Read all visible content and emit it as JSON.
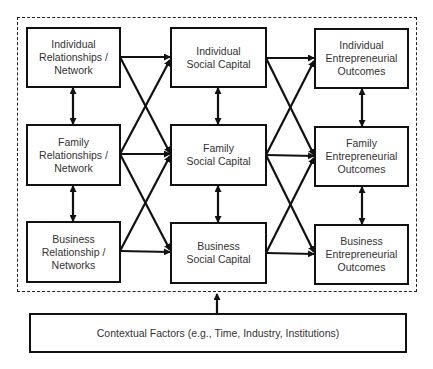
{
  "diagram": {
    "columns": [
      {
        "name": "relationships-networks",
        "nodes": [
          {
            "id": "ind-rel",
            "label": "Individual\nRelationships /\nNetwork"
          },
          {
            "id": "fam-rel",
            "label": "Family\nRelationships /\nNetwork"
          },
          {
            "id": "bus-rel",
            "label": "Business\nRelationship /\nNetworks"
          }
        ]
      },
      {
        "name": "social-capital",
        "nodes": [
          {
            "id": "ind-sc",
            "label": "Individual\nSocial Capital"
          },
          {
            "id": "fam-sc",
            "label": "Family\nSocial Capital"
          },
          {
            "id": "bus-sc",
            "label": "Business\nSocial Capital"
          }
        ]
      },
      {
        "name": "entrepreneurial-outcomes",
        "nodes": [
          {
            "id": "ind-eo",
            "label": "Individual\nEntrepreneurial\nOutcomes"
          },
          {
            "id": "fam-eo",
            "label": "Family\nEntrepreneurial\nOutcomes"
          },
          {
            "id": "bus-eo",
            "label": "Business\nEntrepreneurial\nOutcomes"
          }
        ]
      }
    ],
    "context": {
      "id": "context",
      "label": "Contextual Factors (e.g., Time, Industry, Institutions)"
    },
    "edges": {
      "bidirectional_vertical": [
        [
          "ind-rel",
          "fam-rel"
        ],
        [
          "fam-rel",
          "bus-rel"
        ],
        [
          "ind-sc",
          "fam-sc"
        ],
        [
          "fam-sc",
          "bus-sc"
        ],
        [
          "ind-eo",
          "fam-eo"
        ],
        [
          "fam-eo",
          "bus-eo"
        ]
      ],
      "directed": [
        [
          "ind-rel",
          "ind-sc"
        ],
        [
          "ind-rel",
          "fam-sc"
        ],
        [
          "fam-rel",
          "ind-sc"
        ],
        [
          "fam-rel",
          "fam-sc"
        ],
        [
          "fam-rel",
          "bus-sc"
        ],
        [
          "bus-rel",
          "fam-sc"
        ],
        [
          "bus-rel",
          "bus-sc"
        ],
        [
          "ind-sc",
          "ind-eo"
        ],
        [
          "ind-sc",
          "fam-eo"
        ],
        [
          "fam-sc",
          "ind-eo"
        ],
        [
          "fam-sc",
          "fam-eo"
        ],
        [
          "fam-sc",
          "bus-eo"
        ],
        [
          "bus-sc",
          "fam-eo"
        ],
        [
          "bus-sc",
          "bus-eo"
        ],
        [
          "context",
          "framework"
        ]
      ]
    },
    "colors": {
      "line": "#111111",
      "text": "#333333",
      "background": "#ffffff"
    }
  }
}
